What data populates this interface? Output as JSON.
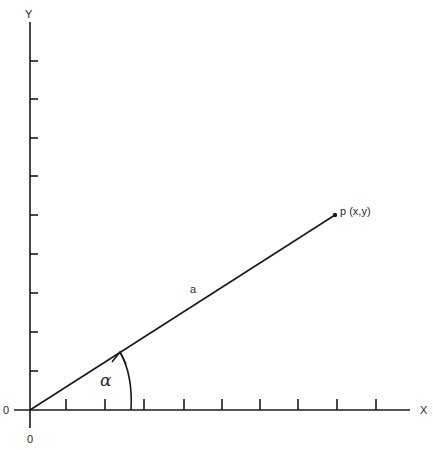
{
  "diagram": {
    "axes": {
      "x_label": "X",
      "y_label": "Y",
      "origin_left_label": "0",
      "origin_bottom_label": "0",
      "x_tick_count": 9,
      "y_tick_count": 9
    },
    "vector": {
      "label": "a",
      "endpoint_label": "p (x,y)",
      "angle_label": "α"
    },
    "colors": {
      "line": "#1a1a1a",
      "background": "#ffffff"
    }
  }
}
